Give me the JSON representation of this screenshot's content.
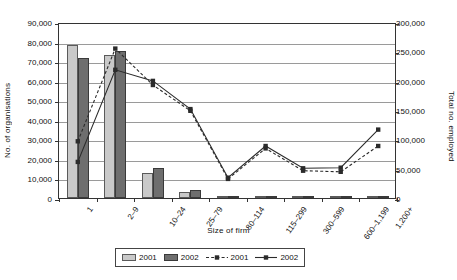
{
  "chart_data": {
    "type": "bar",
    "title": "",
    "xlabel": "Size of firm",
    "ylabel": "No. of organisations",
    "y2label": "Total no. employed",
    "grid": true,
    "legend_position": "bottom",
    "categories": [
      "1",
      "2–9",
      "10–24",
      "25–79",
      "80–114",
      "115–299",
      "300–599",
      "600–1,199",
      "1,200+"
    ],
    "ylim": [
      0,
      90000
    ],
    "yticks": [
      0,
      10000,
      20000,
      30000,
      40000,
      50000,
      60000,
      70000,
      80000,
      90000
    ],
    "ytick_labels": [
      "0",
      "10,000",
      "20,000",
      "30,000",
      "40,000",
      "50,000",
      "60,000",
      "70,000",
      "80,000",
      "90,000"
    ],
    "y2lim": [
      0,
      300000
    ],
    "y2ticks": [
      0,
      50000,
      100000,
      150000,
      200000,
      250000,
      300000
    ],
    "y2tick_labels": [
      "0",
      "50,000",
      "100,000",
      "150,000",
      "200,000",
      "250,000",
      "300,000"
    ],
    "series": [
      {
        "name": "2001",
        "kind": "bar",
        "axis": "left",
        "color": "#c9c9c9",
        "values": [
          78000,
          73000,
          13000,
          3300,
          800,
          600,
          250,
          150,
          120
        ]
      },
      {
        "name": "2002",
        "kind": "bar",
        "axis": "left",
        "color": "#6e6e6e",
        "values": [
          71500,
          75000,
          15500,
          4200,
          1100,
          800,
          300,
          180,
          140
        ]
      },
      {
        "name": "2001",
        "kind": "line",
        "axis": "right",
        "style": "dashed",
        "color": "#2b2b2b",
        "values": [
          100000,
          258000,
          196000,
          152000,
          36000,
          88000,
          50000,
          48000,
          92000
        ]
      },
      {
        "name": "2002",
        "kind": "line",
        "axis": "right",
        "style": "solid",
        "color": "#2b2b2b",
        "values": [
          65000,
          222000,
          203000,
          155000,
          38000,
          92000,
          54000,
          55000,
          120000
        ]
      }
    ]
  },
  "legend": {
    "entries": [
      {
        "label": "2001",
        "type": "bar-light"
      },
      {
        "label": "2002",
        "type": "bar-dark"
      },
      {
        "label": "2001",
        "type": "line-dashed"
      },
      {
        "label": "2002",
        "type": "line-solid"
      }
    ]
  }
}
